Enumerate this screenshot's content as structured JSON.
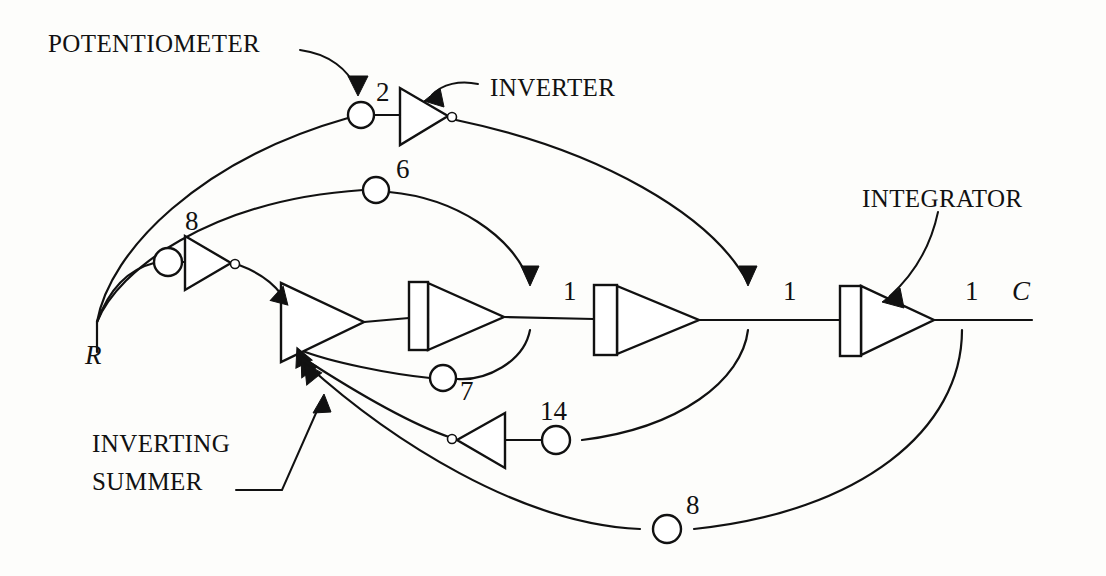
{
  "figure": {
    "type": "signal-flow-diagram",
    "background_color": "#fdfdfb",
    "line_color": "#111111"
  },
  "callouts": {
    "potentiometer": "POTENTIOMETER",
    "inverter": "INVERTER",
    "integrator": "INTEGRATOR",
    "inverting_summer_line1": "INVERTING",
    "inverting_summer_line2": "SUMMER"
  },
  "signals": {
    "input": "R",
    "output": "C"
  },
  "potentiometers": [
    {
      "id": "pot-2",
      "label": "2",
      "cx": 361,
      "cy": 115,
      "r": 13
    },
    {
      "id": "pot-6",
      "label": "6",
      "cx": 376,
      "cy": 190,
      "r": 13
    },
    {
      "id": "pot-8-top",
      "label": "8",
      "cx": 168,
      "cy": 262,
      "r": 14
    },
    {
      "id": "pot-7",
      "label": "7",
      "cx": 443,
      "cy": 378,
      "r": 13
    },
    {
      "id": "pot-14",
      "label": "14",
      "cx": 556,
      "cy": 440,
      "r": 14
    },
    {
      "id": "pot-8-bottom",
      "label": "8",
      "cx": 667,
      "cy": 529,
      "r": 14
    }
  ],
  "gain_labels": [
    {
      "id": "gain-1-a",
      "label": "1",
      "x": 563,
      "y": 300
    },
    {
      "id": "gain-1-b",
      "label": "1",
      "x": 783,
      "y": 300
    },
    {
      "id": "gain-1-c",
      "label": "1",
      "x": 965,
      "y": 300
    }
  ],
  "inverters": [
    {
      "id": "inverter-top",
      "direction": "right",
      "x1": 400,
      "y1": 88,
      "x2": 400,
      "y2": 145,
      "apex_x": 448,
      "apex_y": 116
    },
    {
      "id": "inverter-8",
      "direction": "right",
      "x1": 185,
      "y1": 236,
      "x2": 185,
      "y2": 290,
      "apex_x": 231,
      "apex_y": 263
    },
    {
      "id": "inverter-14",
      "direction": "left",
      "x1": 505,
      "y1": 413,
      "x2": 505,
      "y2": 468,
      "apex_x": 457,
      "apex_y": 440
    }
  ],
  "summers": [
    {
      "id": "inverting-summer",
      "x_left": 281,
      "y_top": 283,
      "y_bottom": 362,
      "apex_x": 364,
      "apex_y": 322
    }
  ],
  "integrators": [
    {
      "id": "integrator-1",
      "rect_x": 409,
      "rect_y": 282,
      "rect_w": 19,
      "rect_h": 68,
      "apex_x": 504,
      "apex_y": 317
    },
    {
      "id": "integrator-2",
      "rect_x": 594,
      "rect_y": 285,
      "rect_w": 23,
      "rect_h": 70,
      "apex_x": 699,
      "apex_y": 320
    },
    {
      "id": "integrator-3",
      "rect_x": 840,
      "rect_y": 286,
      "rect_w": 21,
      "rect_h": 70,
      "apex_x": 934,
      "apex_y": 320
    }
  ],
  "nodes": {
    "input_fanout": {
      "x": 97,
      "y": 322
    },
    "output_end": {
      "x": 1032,
      "y": 320
    }
  }
}
